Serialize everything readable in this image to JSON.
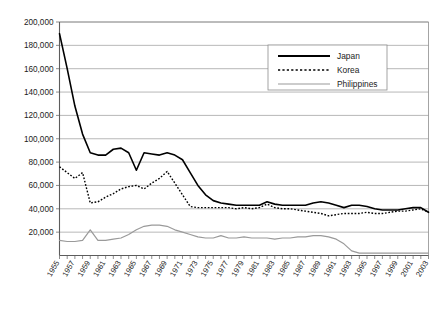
{
  "chart_data": {
    "type": "line",
    "title": "",
    "subtitle": "",
    "xlabel": "",
    "ylabel": "",
    "xlim": [
      1955,
      2003
    ],
    "ylim": [
      0,
      200000
    ],
    "grid": true,
    "grid_axis": "y",
    "legend_position": "top-right",
    "y_ticks": [
      0,
      20000,
      40000,
      60000,
      80000,
      100000,
      120000,
      140000,
      160000,
      180000,
      200000
    ],
    "y_tick_labels": [
      "0",
      "20,000",
      "40,000",
      "60,000",
      "80,000",
      "100,000",
      "120,000",
      "140,000",
      "160,000",
      "180,000",
      "200,000"
    ],
    "y_tick_labels_shown": [
      "20,000",
      "40,000",
      "60,000",
      "80,000",
      "100,000",
      "120,000",
      "140,000",
      "160,000",
      "180,000",
      "200,000"
    ],
    "x": [
      1955,
      1956,
      1957,
      1958,
      1959,
      1960,
      1961,
      1962,
      1963,
      1964,
      1965,
      1966,
      1967,
      1968,
      1969,
      1970,
      1971,
      1972,
      1973,
      1974,
      1975,
      1976,
      1977,
      1978,
      1979,
      1980,
      1981,
      1982,
      1983,
      1984,
      1985,
      1986,
      1987,
      1988,
      1989,
      1990,
      1991,
      1992,
      1993,
      1994,
      1995,
      1996,
      1997,
      1998,
      1999,
      2000,
      2001,
      2002,
      2003
    ],
    "x_tick_labels": [
      "1955",
      "1957",
      "1959",
      "1961",
      "1963",
      "1965",
      "1967",
      "1969",
      "1971",
      "1973",
      "1975",
      "1977",
      "1979",
      "1981",
      "1983",
      "1985",
      "1987",
      "1989",
      "1991",
      "1993",
      "1995",
      "1997",
      "1999",
      "2001",
      "2003"
    ],
    "series": [
      {
        "name": "Japan",
        "color": "#000000",
        "style": "solid",
        "width": 1.6,
        "values": [
          190000,
          160000,
          128000,
          104000,
          88000,
          86000,
          86000,
          91000,
          92000,
          88000,
          73000,
          88000,
          87000,
          86000,
          88000,
          86000,
          82000,
          71000,
          60000,
          52000,
          47000,
          45000,
          44000,
          43000,
          43000,
          43000,
          43000,
          46000,
          44000,
          43000,
          43000,
          43000,
          43000,
          45000,
          46000,
          45000,
          43000,
          41000,
          43000,
          43000,
          42000,
          40000,
          39000,
          39000,
          39000,
          40000,
          41000,
          41000,
          37000
        ]
      },
      {
        "name": "Korea",
        "color": "#000000",
        "style": "dotted",
        "width": 1.4,
        "values": [
          76000,
          71000,
          66000,
          71000,
          45000,
          46000,
          50000,
          53000,
          57000,
          59000,
          60000,
          57000,
          62000,
          66000,
          72000,
          62000,
          52000,
          42000,
          41000,
          41000,
          41000,
          41000,
          41000,
          40000,
          41000,
          40000,
          41000,
          44000,
          41000,
          40000,
          40000,
          39000,
          38000,
          37000,
          36000,
          34000,
          35000,
          36000,
          36000,
          36000,
          37000,
          36000,
          36000,
          37000,
          38000,
          38000,
          39000,
          40000,
          37000
        ]
      },
      {
        "name": "Philippines",
        "color": "#9a9a9a",
        "style": "solid",
        "width": 1.2,
        "values": [
          13000,
          12000,
          12000,
          13000,
          22000,
          13000,
          13000,
          14000,
          15000,
          18000,
          22000,
          25000,
          26000,
          26000,
          25000,
          22000,
          20000,
          18000,
          16000,
          15000,
          15000,
          17000,
          15000,
          15000,
          16000,
          15000,
          15000,
          15000,
          14000,
          15000,
          15000,
          16000,
          16000,
          17000,
          17000,
          16000,
          14000,
          10000,
          4000,
          2000,
          2000,
          2000,
          2000,
          2000,
          2000,
          2000,
          2000,
          2000,
          2000
        ]
      }
    ],
    "legend": [
      {
        "label": "Japan",
        "color": "#000000",
        "style": "solid"
      },
      {
        "label": "Korea",
        "color": "#000000",
        "style": "dotted"
      },
      {
        "label": "Philippines",
        "color": "#9a9a9a",
        "style": "solid"
      }
    ]
  },
  "colors": {
    "japan": "#000000",
    "korea": "#000000",
    "philippines": "#9a9a9a",
    "gridline": "#9a9a9a",
    "axis": "#5d5d5d",
    "background": "#ffffff",
    "text": "#1b1b1b"
  }
}
